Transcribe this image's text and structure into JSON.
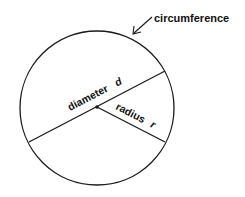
{
  "diagram": {
    "labels": {
      "circumference": "circumference",
      "diameter": "diameter",
      "diameter_symbol": "d",
      "radius": "radius",
      "radius_symbol": "r"
    },
    "colors": {
      "stroke": "#1a1a1a",
      "background": "#ffffff"
    }
  }
}
